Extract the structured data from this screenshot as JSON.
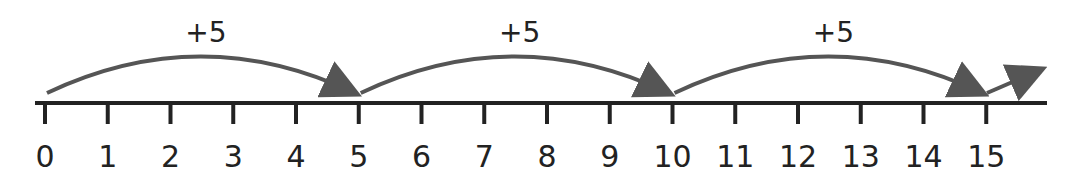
{
  "number_line": {
    "start": 0,
    "end": 15,
    "tick_labels": [
      "0",
      "1",
      "2",
      "3",
      "4",
      "5",
      "6",
      "7",
      "8",
      "9",
      "10",
      "11",
      "12",
      "13",
      "14",
      "15"
    ],
    "axis_color": "#222222",
    "arrow_color": "#555555"
  },
  "jumps": [
    {
      "from": 0,
      "to": 5,
      "label": "+5"
    },
    {
      "from": 5,
      "to": 10,
      "label": "+5"
    },
    {
      "from": 10,
      "to": 15,
      "label": "+5"
    }
  ],
  "continuation_arrow": {
    "from": 15,
    "direction": "up-right"
  }
}
